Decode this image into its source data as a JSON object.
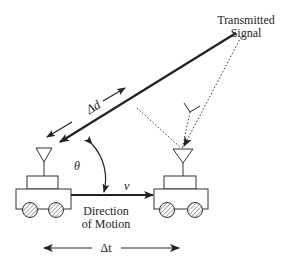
{
  "diagram": {
    "labels": {
      "transmitted_line1": "Transmitted",
      "transmitted_line2": "Signal",
      "delta_d": "Δd",
      "theta": "θ",
      "velocity": "v",
      "direction_line1": "Direction",
      "direction_line2": "of Motion",
      "delta_t": "Δt"
    },
    "colors": {
      "ink": "#222222",
      "background": "#ffffff",
      "hatch": "#555555"
    }
  }
}
